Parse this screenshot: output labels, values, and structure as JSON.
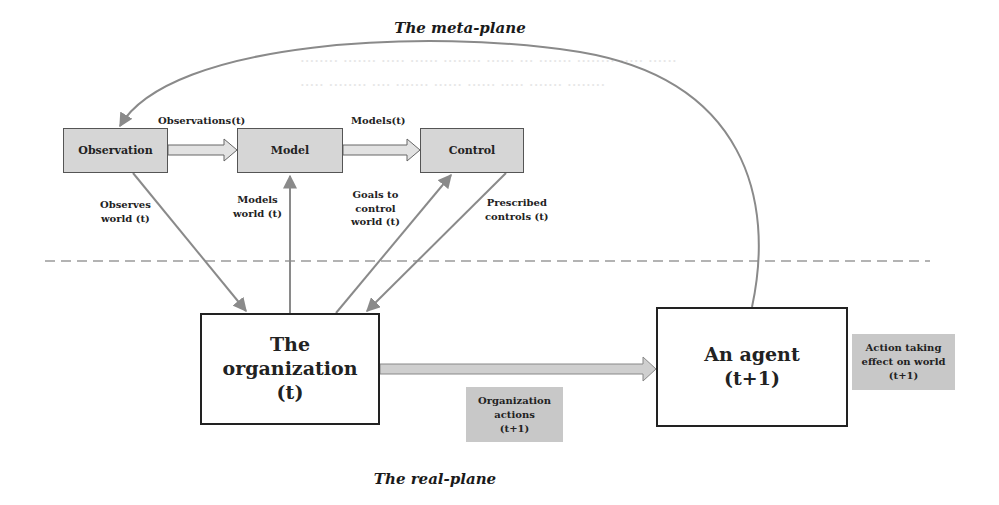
{
  "diagram": {
    "meta_plane_title": "The meta-plane",
    "real_plane_title": "The real-plane",
    "meta_nodes": [
      {
        "id": "observation",
        "label": "Observation"
      },
      {
        "id": "model",
        "label": "Model"
      },
      {
        "id": "control",
        "label": "Control"
      }
    ],
    "meta_flows": [
      {
        "from": "observation",
        "to": "model",
        "label": "Observations(t)"
      },
      {
        "from": "model",
        "to": "control",
        "label": "Models(t)"
      }
    ],
    "cross_links": [
      {
        "label_line1": "Observes",
        "label_line2": "world (t)",
        "direction": "observation -> organization"
      },
      {
        "label_line1": "Models",
        "label_line2": "world (t)",
        "direction": "organization -> model"
      },
      {
        "label_line1": "Goals to",
        "label_line2": "control",
        "label_line3": "world (t)",
        "direction": "organization -> control"
      },
      {
        "label_line1": "Prescribed",
        "label_line2": "controls (t)",
        "direction": "control -> organization"
      }
    ],
    "organization": {
      "line1": "The organization",
      "line2": "(t)"
    },
    "agent": {
      "line1": "An agent",
      "line2": "(t+1)"
    },
    "organization_actions": {
      "line1": "Organization",
      "line2": "actions",
      "line3": "(t+1)"
    },
    "action_effect": {
      "line1": "Action taking",
      "line2": "effect on world",
      "line3": "(t+1)"
    },
    "feedback": "An agent -> Observation"
  },
  "colors": {
    "gray_box": "#d6d6d6",
    "label_box": "#c8c8c8",
    "arrow": "#8a8a8a",
    "border": "#222222",
    "dashed": "#9a9a9a"
  }
}
